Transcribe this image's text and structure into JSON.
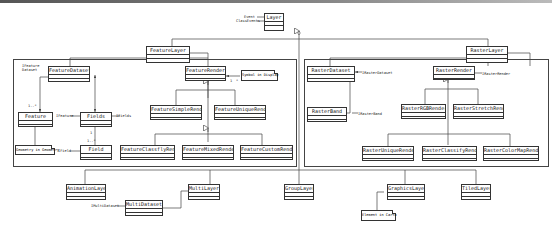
{
  "diagram": {
    "type": "UML class diagram",
    "root": {
      "name": "Layer",
      "attributes": [
        "Event",
        "ClassEvents"
      ]
    },
    "packages": [
      {
        "name": "feature-package"
      },
      {
        "name": "raster-package"
      }
    ],
    "classes": {
      "layer": "Layer",
      "feature_layer": "FeatureLayer",
      "raster_layer": "RasterLayer",
      "feature_dataset": "FeatureDataset",
      "feature_render": "FeatureRender",
      "feature": "Feature",
      "fields": "Fields",
      "field": "Field",
      "feature_simple_render": "FeatureSimpleRender",
      "feature_unique_render": "FeatureUniqueRender",
      "feature_classify_render": "FeatureClassflyRender",
      "feature_mixed_render": "FeatureMixedRender",
      "feature_custom_render": "FeatureCustomRender",
      "raster_dataset": "RasterDataset",
      "raster_band": "RasterBand",
      "raster_render": "RasterRender",
      "raster_rgb_render": "RasterRGBRender",
      "raster_stretch_render": "RasterStretchRender",
      "raster_unique_render": "RasterUniqueRender",
      "raster_classify_render": "RasterClassifyRender",
      "raster_colormap_render": "RasterColorMapRender",
      "animation_layer": "AnimationLayer",
      "multi_layer": "MultiLayer",
      "multi_dataset": "MultiDataset",
      "group_layer": "GroupLayer",
      "graphics_layer": "GraphicsLayer",
      "tiled_layer": "TiledLayer"
    },
    "notes": {
      "geometry": "Geometry in Geometry",
      "symbol_display": "Symbol in Display",
      "element_carto": "Element in Carto"
    },
    "labels": {
      "event": "Event",
      "class_events": "ClassEvents",
      "ifeature_dataset": "IFeature Dataset",
      "ifeature": "IFeature",
      "ifields": "IFields",
      "ifield": "IField",
      "mult_1_n": "1..*",
      "mult_1": "1",
      "mult_1b": "1",
      "mult_star": "*",
      "mult_1_n_field": "1..*",
      "iraster_dataset": "IRasterDataset",
      "iraster_band": "IRasterBand",
      "iraster_render": "IRasterRender",
      "imulti_dataset": "IMultiDataset"
    }
  }
}
